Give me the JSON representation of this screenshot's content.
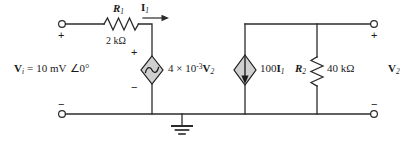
{
  "diagram": {
    "colors": {
      "wire": "#2b2b2b",
      "source_fill": "#cfcfcf",
      "source_stroke": "#1a1a1a",
      "text": "#1a1a1a",
      "background": "#ffffff"
    }
  },
  "components": {
    "r1": {
      "name": "R",
      "subscript": "1",
      "value": "2 kΩ"
    },
    "r2": {
      "name": "R",
      "subscript": "2",
      "value": "40 kΩ"
    },
    "vcvs": {
      "label_coefficient": "4 × 10",
      "label_exponent": "-3",
      "label_variable": "V",
      "label_variable_sub": "2",
      "type": "dependent-voltage-source",
      "polarity_top": "+",
      "polarity_bottom": "−"
    },
    "cccs": {
      "label_coefficient": "100",
      "label_variable": "I",
      "label_variable_sub": "1",
      "type": "dependent-current-source",
      "arrow_direction": "down"
    }
  },
  "labels": {
    "current_i1": {
      "symbol": "I",
      "subscript": "1"
    },
    "source_v1": {
      "symbol": "V",
      "subscript": "i",
      "equals": "=",
      "magnitude": "10 mV",
      "angle": "∠0°",
      "full": "V_i = 10 mV ∠0°"
    },
    "output_v2": {
      "symbol": "V",
      "subscript": "2"
    }
  },
  "terminals": {
    "left_top_sign": "+",
    "left_bottom_sign": "−",
    "right_top_sign": "+",
    "right_bottom_sign": "−"
  },
  "ground": {
    "name": "ground-symbol"
  }
}
